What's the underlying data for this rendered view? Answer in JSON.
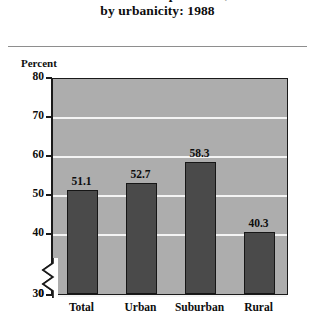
{
  "title": {
    "lines": [
      "who attended preschool,",
      "by urbanicity: 1988"
    ],
    "cropped_top_line": true
  },
  "axis": {
    "y_label": "Percent",
    "y_ticks": [
      "80",
      "70",
      "60",
      "50",
      "40",
      "30",
      "0"
    ],
    "has_axis_break": true
  },
  "chart_data": {
    "type": "bar",
    "title": "who attended preschool, by urbanicity: 1988",
    "xlabel": "",
    "ylabel": "Percent",
    "categories": [
      "Total",
      "Urban",
      "Suburban",
      "Rural"
    ],
    "values": [
      51.1,
      52.7,
      58.3,
      40.3
    ],
    "value_labels": [
      "51.1",
      "52.7",
      "58.3",
      "40.3"
    ],
    "ylim": [
      0,
      80
    ],
    "yticks": [
      0,
      30,
      40,
      50,
      60,
      70,
      80
    ],
    "ytick_labels": [
      "0",
      "30",
      "40",
      "50",
      "60",
      "70",
      "80"
    ],
    "axis_break": {
      "from": 0,
      "to": 30
    },
    "grid": true,
    "gridlines_at": [
      30,
      40,
      50,
      60,
      70
    ],
    "legend": "none",
    "bar_color": "#4a4a4a",
    "plot_background": "#adadad",
    "gridline_color": "#f4f4f4"
  }
}
